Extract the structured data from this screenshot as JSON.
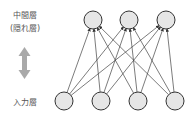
{
  "labels": {
    "hidden_layer_line1": "中間層",
    "hidden_layer_line2": "(隠れ層)",
    "input_layer": "入力層"
  },
  "diagram": {
    "type": "fully-connected neural network (2 layers)",
    "hidden_layer": {
      "node_count": 3,
      "x": [
        93,
        129,
        166
      ],
      "y": 20
    },
    "input_layer": {
      "node_count": 4,
      "x": [
        64,
        101,
        138,
        175
      ],
      "y": 101
    },
    "connections": "every input node connects to every hidden node (12 edges, arrows pointing up)",
    "node_fill": "#e6e6e6",
    "node_stroke": "#333333",
    "edge_color": "#444444",
    "double_arrow_color": "#a9a9a9"
  }
}
